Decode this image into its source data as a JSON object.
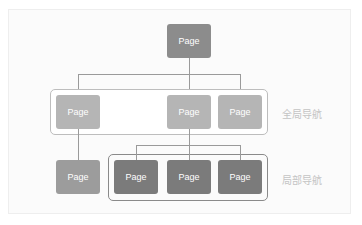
{
  "colors": {
    "root": "#8c8c8c",
    "global_nav": "#b5b5b5",
    "standalone": "#9c9c9c",
    "local_nav": "#7b7b7b",
    "connector": "#9a9a9a",
    "label_text": "#c4c4c4"
  },
  "diagram": {
    "root": {
      "label": "Page"
    },
    "global_nav": {
      "title": "全局导航",
      "nodes": [
        {
          "label": "Page"
        },
        {
          "label": "Page"
        },
        {
          "label": "Page"
        }
      ]
    },
    "standalone": {
      "label": "Page"
    },
    "local_nav": {
      "title": "局部导航",
      "nodes": [
        {
          "label": "Page"
        },
        {
          "label": "Page"
        },
        {
          "label": "Page"
        }
      ]
    }
  }
}
